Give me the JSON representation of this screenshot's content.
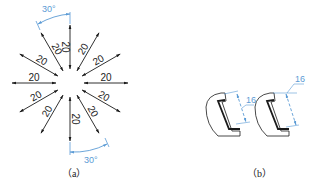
{
  "figure_a": {
    "caption": "（a）",
    "center": [
      70,
      83
    ],
    "dimension_value": "20",
    "angles_deg": [
      90,
      60,
      30,
      0,
      -30,
      -60,
      -90,
      -120,
      -150,
      180,
      150,
      120
    ],
    "angle_label_top": "30°",
    "angle_label_bottom": "30°"
  },
  "figure_b": {
    "caption": "（b）",
    "left_dimension": "16",
    "right_dimension": "16"
  },
  "colors": {
    "line": "#1a1a1a",
    "dimension_blue": "#5b9bd5"
  }
}
